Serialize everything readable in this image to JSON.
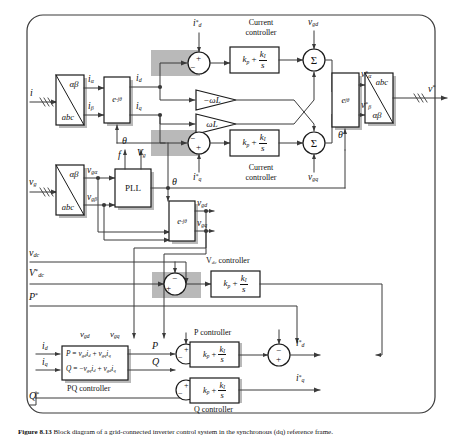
{
  "figure": {
    "caption_bold": "Figure 8.13",
    "caption_text": "Block diagram of a grid-connected inverter control system in the synchronous (dq) reference frame."
  },
  "signals": {
    "i_in": "i",
    "vg_in": "v_g",
    "vdc": "v_dc",
    "vdc_ref": "V*_dc",
    "p_ref": "P*",
    "q_ref": "Q*",
    "v_out": "v*",
    "i_alpha": "i_α",
    "i_beta": "i_β",
    "i_d": "i_d",
    "i_q": "i_q",
    "i_d_ref": "i*_d",
    "i_q_ref": "i*_q",
    "vg_alpha": "v_gα",
    "vg_beta": "v_gβ",
    "vg_d": "v_gd",
    "vg_q": "v_gq",
    "v_alpha_ref": "v*_α",
    "v_beta_ref": "v*_β",
    "theta": "θ",
    "freq": "f",
    "vg_mag": "V_g",
    "p": "P",
    "q": "Q"
  },
  "blocks": {
    "clarke_i": {
      "top": "αβ",
      "bottom": "abc"
    },
    "clarke_vg": {
      "top": "αβ",
      "bottom": "abc"
    },
    "inv_clarke": {
      "top": "abc",
      "bottom": "αβ"
    },
    "park_i": "e^{-jθ}",
    "park_vg": "e^{-jθ}",
    "inv_park": "e^{jθ}",
    "pll": "PLL",
    "gain_neg": "-ωL",
    "gain_pos": "ωL",
    "pi_kp": "k_p",
    "pi_ki": "k_I",
    "pi_s": "s",
    "pq_eq_p": "P = v_gd i_d + v_gq i_q",
    "pq_eq_q": "Q = -v_gq i_d + v_gd i_q",
    "sigma": "Σ"
  },
  "labels": {
    "current_controller_top": "Current controller",
    "current_controller_bottom": "Current controller",
    "vdc_controller": "V_dc controller",
    "p_controller": "P controller",
    "q_controller": "Q controller",
    "pq_controller": "PQ controller"
  },
  "signs": {
    "sum_id_top": "+",
    "sum_id_left": "-",
    "sum_iq_left": "-",
    "sum_iq_bottom": "+",
    "sum_vdc_top": "-",
    "sum_vdc_left": "+",
    "sum_p_top": "+",
    "sum_p_left": "-",
    "sum_q_top": "+",
    "sum_q_left": "-",
    "sum_idref_top": "-",
    "sum_idref_bottom": "+"
  },
  "colors": {
    "line": "#3a3a3a",
    "block_border": "#1a1a1a",
    "block_fill": "#ffffff",
    "shadow": "#b9b9b9",
    "text": "#111111",
    "background": "#ffffff"
  }
}
